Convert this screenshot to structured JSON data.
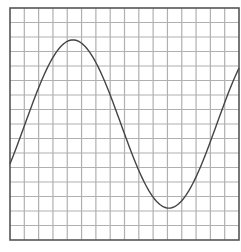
{
  "chart_data": {
    "type": "line",
    "title": "",
    "xlabel": "",
    "ylabel": "",
    "grid": true,
    "grid_divisions": {
      "x": 16,
      "y": 16
    },
    "xlim": [
      0,
      16
    ],
    "ylim": [
      -8,
      8
    ],
    "legend": null,
    "series": [
      {
        "name": "sine wave",
        "function": "y = 5.8 * sin(2*pi*(x - 1.05) / 13.4)",
        "x": [
          0,
          1,
          2,
          3,
          4,
          5,
          6,
          7,
          8,
          9,
          10,
          11,
          12,
          13,
          14,
          15,
          16
        ],
        "values": [
          -2.6,
          -0.2,
          2.4,
          4.4,
          5.6,
          5.7,
          4.8,
          3.0,
          0.6,
          -1.9,
          -4.0,
          -5.4,
          -5.8,
          -5.1,
          -3.6,
          -1.3,
          1.2
        ]
      }
    ]
  },
  "colors": {
    "background": "#ffffff",
    "frame": "#555555",
    "grid": "#b0b0b0",
    "curve": "#444444"
  }
}
